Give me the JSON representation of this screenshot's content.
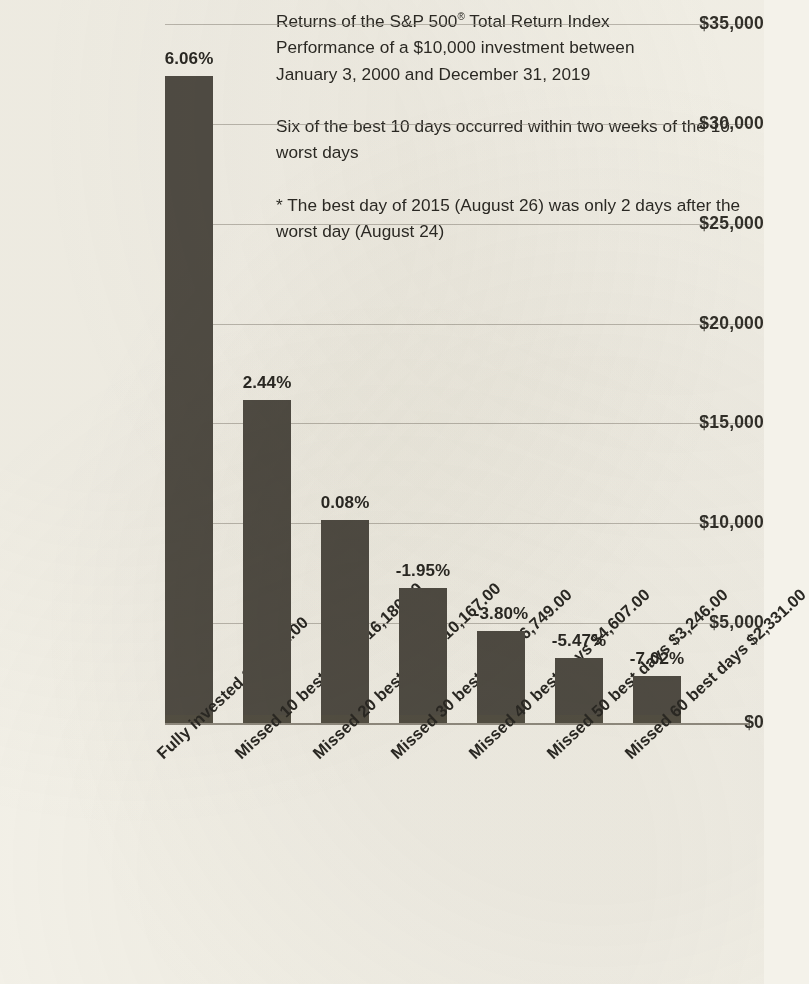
{
  "notes": {
    "title_line_1": "Returns of the S&P 500",
    "title_reg_mark": "®",
    "title_line_1_cont": " Total Return Index",
    "title_line_2": "Performance of a $10,000 investment between",
    "title_line_3": "January 3, 2000 and December 31, 2019",
    "para_2": "Six of the best 10 days occurred within two weeks of the 10 worst days",
    "para_3": "* The best day of 2015 (August 26) was only 2 days after the worst day (August 24)"
  },
  "chart_data": {
    "type": "bar",
    "title": "Returns of the S&P 500® Total Return Index",
    "subtitle": "Performance of a $10,000 investment between January 3, 2000 and December 31, 2019",
    "xlabel": "",
    "ylabel": "",
    "ylim": [
      0,
      35000
    ],
    "grid": true,
    "legend": "none",
    "ytick_labels": [
      "$35,000",
      "$30,000",
      "$25,000",
      "$20,000",
      "$15,000",
      "$10,000",
      "$5,000",
      "$0"
    ],
    "ytick_values": [
      35000,
      30000,
      25000,
      20000,
      15000,
      10000,
      5000,
      0
    ],
    "categories": [
      "Fully invested $32,421.00",
      "Missed 10 best days $16,180.00",
      "Missed 20 best days $10,167.00",
      "Missed 30 best days $6,749.00",
      "Missed 40 best days $4,607.00",
      "Missed 50 best days $3,246.00",
      "Missed 60 best days $2,331.00"
    ],
    "values": [
      32421,
      16180,
      10167,
      6749,
      4607,
      3246,
      2331
    ],
    "value_labels": [
      "$32,421.00",
      "$16,180.00",
      "$10,167.00",
      "$6,749.00",
      "$4,607.00",
      "$3,246.00",
      "$2,331.00"
    ],
    "annualized_return_labels": [
      "6.06%",
      "2.44%",
      "0.08%",
      "-1.95%",
      "-3.80%",
      "-5.47%",
      "-7.02%"
    ],
    "annualized_return_values": [
      6.06,
      2.44,
      0.08,
      -1.95,
      -3.8,
      -5.47,
      -7.02
    ],
    "bar_color": "#514d45",
    "background_color": "#f4f2ea",
    "gridline_color": "#9a958a"
  }
}
